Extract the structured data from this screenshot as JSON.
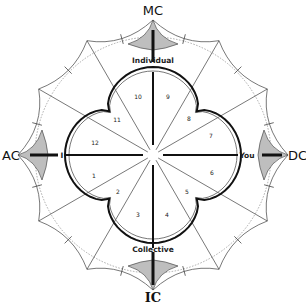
{
  "diagram": {
    "axes": {
      "top": "MC",
      "bottom": "IC",
      "left": "AC",
      "right": "DC"
    },
    "pole_labels": {
      "top": "Individual",
      "bottom": "Collective",
      "right": "You",
      "left": "I"
    },
    "segments": [
      "1",
      "2",
      "3",
      "4",
      "5",
      "6",
      "7",
      "8",
      "9",
      "10",
      "11",
      "12"
    ],
    "colors": {
      "ink": "#111111",
      "thin_line": "#555555",
      "dotted_circle": "#999999",
      "background": "#ffffff"
    }
  }
}
